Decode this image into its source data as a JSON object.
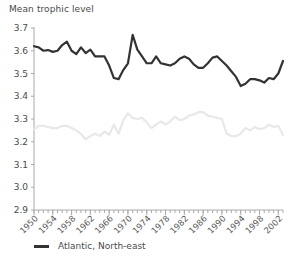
{
  "chart_data": {
    "type": "line",
    "title": "Mean trophic level",
    "xlabel": "",
    "ylabel": "Mean trophic level",
    "xlim": [
      1950,
      2003
    ],
    "ylim": [
      2.9,
      3.7
    ],
    "grid": false,
    "legend_position": "bottom-left",
    "y_ticks": [
      "2.9",
      "3.0",
      "3.1",
      "3.2",
      "3.3",
      "3.4",
      "3.5",
      "3.6",
      "3.7"
    ],
    "y_tick_values": [
      2.9,
      3.0,
      3.1,
      3.2,
      3.3,
      3.4,
      3.5,
      3.6,
      3.7
    ],
    "x_ticks": [
      "1950",
      "1954",
      "1958",
      "1962",
      "1966",
      "1970",
      "1974",
      "1978",
      "1982",
      "1986",
      "1990",
      "1994",
      "1998",
      "2002"
    ],
    "x_tick_values": [
      1950,
      1954,
      1958,
      1962,
      1966,
      1970,
      1974,
      1978,
      1982,
      1986,
      1990,
      1994,
      1998,
      2002
    ],
    "x_minor_tick_step": 1,
    "x": [
      1950,
      1951,
      1952,
      1953,
      1954,
      1955,
      1956,
      1957,
      1958,
      1959,
      1960,
      1961,
      1962,
      1963,
      1964,
      1965,
      1966,
      1967,
      1968,
      1969,
      1970,
      1971,
      1972,
      1973,
      1974,
      1975,
      1976,
      1977,
      1978,
      1979,
      1980,
      1981,
      1982,
      1983,
      1984,
      1985,
      1986,
      1987,
      1988,
      1989,
      1990,
      1991,
      1992,
      1993,
      1994,
      1995,
      1996,
      1997,
      1998,
      1999,
      2000,
      2001,
      2002,
      2003
    ],
    "series": [
      {
        "name": "Atlantic, North-east",
        "color": "#333333",
        "width": 2.2,
        "in_legend": true,
        "values": [
          3.62,
          3.615,
          3.6,
          3.603,
          3.595,
          3.6,
          3.625,
          3.64,
          3.6,
          3.585,
          3.615,
          3.59,
          3.605,
          3.575,
          3.575,
          3.575,
          3.535,
          3.48,
          3.475,
          3.515,
          3.545,
          3.67,
          3.605,
          3.575,
          3.545,
          3.545,
          3.575,
          3.545,
          3.54,
          3.535,
          3.545,
          3.565,
          3.575,
          3.565,
          3.54,
          3.525,
          3.525,
          3.545,
          3.57,
          3.575,
          3.555,
          3.535,
          3.51,
          3.485,
          3.445,
          3.455,
          3.475,
          3.475,
          3.47,
          3.46,
          3.48,
          3.475,
          3.5,
          3.555
        ]
      },
      {
        "name": "secondary-series",
        "color": "#e8e8e8",
        "width": 2.2,
        "in_legend": false,
        "values": [
          3.255,
          3.27,
          3.27,
          3.265,
          3.26,
          3.26,
          3.27,
          3.27,
          3.26,
          3.25,
          3.235,
          3.21,
          3.225,
          3.235,
          3.225,
          3.245,
          3.23,
          3.275,
          3.235,
          3.295,
          3.325,
          3.305,
          3.3,
          3.305,
          3.285,
          3.26,
          3.275,
          3.29,
          3.275,
          3.29,
          3.31,
          3.295,
          3.3,
          3.315,
          3.32,
          3.33,
          3.33,
          3.315,
          3.31,
          3.305,
          3.3,
          3.235,
          3.225,
          3.225,
          3.235,
          3.26,
          3.25,
          3.265,
          3.255,
          3.26,
          3.275,
          3.265,
          3.27,
          3.23
        ]
      }
    ],
    "axis_color": "#aaaaaa",
    "text_color": "#4a4a4a"
  },
  "legend": {
    "entries": [
      {
        "label": "Atlantic, North-east",
        "color": "#333333"
      }
    ]
  }
}
